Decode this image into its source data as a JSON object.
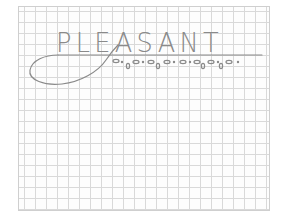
{
  "drawing": {
    "type": "pencil sketch on graph paper",
    "word": "PLEASANT",
    "colors": {
      "pencil": "#8a8a8a",
      "grid": "#d9d9d9",
      "paper": "#fdfdfd"
    }
  }
}
